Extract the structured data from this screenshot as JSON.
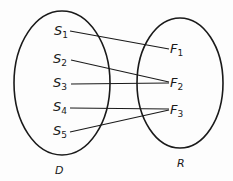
{
  "diagram": {
    "domain_set": {
      "label": "D",
      "elements": [
        {
          "name": "S",
          "sub": "1"
        },
        {
          "name": "S",
          "sub": "2"
        },
        {
          "name": "S",
          "sub": "3"
        },
        {
          "name": "S",
          "sub": "4"
        },
        {
          "name": "S",
          "sub": "5"
        }
      ]
    },
    "range_set": {
      "label": "R",
      "elements": [
        {
          "name": "F",
          "sub": "1"
        },
        {
          "name": "F",
          "sub": "2"
        },
        {
          "name": "F",
          "sub": "3"
        }
      ]
    },
    "mappings": [
      {
        "from": "S1",
        "to": "F1"
      },
      {
        "from": "S2",
        "to": "F2"
      },
      {
        "from": "S3",
        "to": "F2"
      },
      {
        "from": "S4",
        "to": "F3"
      },
      {
        "from": "S5",
        "to": "F3"
      }
    ],
    "line_color": "#1a1a1a"
  }
}
